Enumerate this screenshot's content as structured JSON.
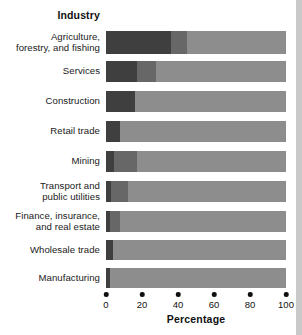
{
  "chart_data": {
    "type": "bar",
    "orientation": "horizontal",
    "stacked": true,
    "normalized_percent": true,
    "title": "",
    "category_axis_title": "Industry",
    "xlabel": "Percentage",
    "ylabel": "Industry",
    "xlim": [
      0,
      100
    ],
    "xticks": [
      0,
      20,
      40,
      60,
      80,
      100
    ],
    "xtick_labels": [
      "0",
      "20",
      "40",
      "60",
      "80",
      "100"
    ],
    "grid": false,
    "legend": "none",
    "categories": [
      "Agriculture, forestry, and fishing",
      "Services",
      "Construction",
      "Retail trade",
      "Mining",
      "Transport and public utilities",
      "Finance, insurance, and real estate",
      "Wholesale trade",
      "Manufacturing"
    ],
    "category_labels_lines": [
      [
        "Agriculture,",
        "forestry, and fishing"
      ],
      [
        "Services"
      ],
      [
        "Construction"
      ],
      [
        "Retail trade"
      ],
      [
        "Mining"
      ],
      [
        "Transport and",
        "public utilities"
      ],
      [
        "Finance, insurance,",
        "and real estate"
      ],
      [
        "Wholesale trade"
      ],
      [
        "Manufacturing"
      ]
    ],
    "series": [
      {
        "name": "segment-1",
        "color": "#3f3f3f",
        "values": [
          36,
          17,
          16,
          8,
          4.5,
          3,
          2,
          4,
          2
        ]
      },
      {
        "name": "segment-2",
        "color": "#676767",
        "values": [
          9,
          11,
          0,
          0,
          12.5,
          9,
          6,
          0,
          0
        ]
      },
      {
        "name": "segment-3",
        "color": "#8d8d8d",
        "values": [
          55,
          72,
          84,
          92,
          83,
          88,
          92,
          96,
          98
        ]
      }
    ],
    "cumulative_boundaries": [
      [
        36,
        45
      ],
      [
        17,
        28
      ],
      [
        16,
        16
      ],
      [
        8,
        8
      ],
      [
        4.5,
        17
      ],
      [
        3,
        12
      ],
      [
        2,
        8
      ],
      [
        4,
        4
      ],
      [
        2,
        2
      ]
    ]
  },
  "colors": {
    "background": "#ffffff",
    "text": "#1a1a1a",
    "tick": "#111111",
    "segment_dark": "#3f3f3f",
    "segment_mid": "#676767",
    "segment_light": "#8d8d8d",
    "right_strip": "#c9c9c9"
  }
}
